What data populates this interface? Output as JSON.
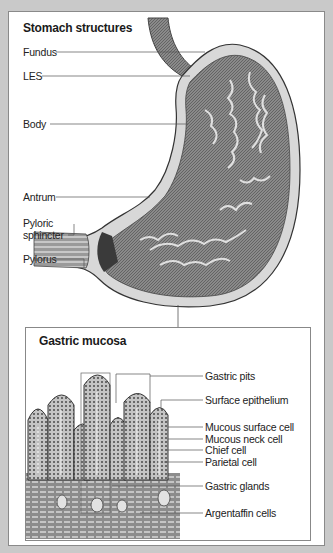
{
  "stomach": {
    "title": "Stomach structures",
    "labels": {
      "fundus": "Fundus",
      "les": "LES",
      "body": "Body",
      "antrum": "Antrum",
      "pyloric_sphincter_1": "Pyloric",
      "pyloric_sphincter_2": "sphincter",
      "pylorus": "Pylorus"
    }
  },
  "mucosa": {
    "title": "Gastric mucosa",
    "labels": {
      "gastric_pits": "Gastric pits",
      "surface_epithelium": "Surface epithelium",
      "mucous_surface_cell": "Mucous surface cell",
      "mucous_neck_cell": "Mucous neck cell",
      "chief_cell": "Chief cell",
      "parietal_cell": "Parietal cell",
      "gastric_glands": "Gastric glands",
      "argentaffin_cells": "Argentaffin cells"
    }
  },
  "colors": {
    "background": "#c9c9c9",
    "panel": "#ffffff",
    "tissue": "#7a7a7a",
    "leader_line": "#555555"
  }
}
